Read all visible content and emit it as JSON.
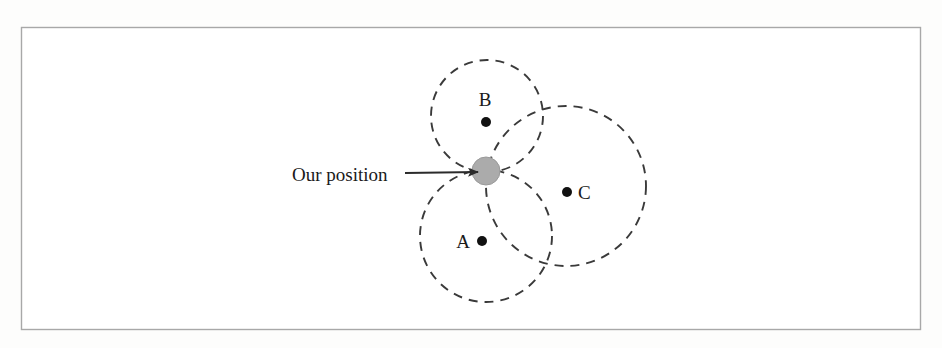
{
  "figure": {
    "name": "trilateration-position-diagram",
    "background_color": "#fdfdfc",
    "frame": {
      "name": "figure-border",
      "x": 21,
      "y": 27,
      "width": 900,
      "height": 303,
      "stroke_color": "#a8a8a8",
      "fill_color": "#ffffff"
    },
    "callout": {
      "label": "Our position",
      "label_x": 292,
      "label_y": 181,
      "arrow": {
        "name": "callout-arrow",
        "x1": 405,
        "y1": 173,
        "x2": 478,
        "y2": 172,
        "color": "#2b2b2b"
      }
    },
    "our_position_marker": {
      "name": "our-position-marker",
      "cx": 486,
      "cy": 171,
      "r": 14,
      "fill_color": "#ababab",
      "stroke_color": "#9a9a9a"
    },
    "circles": [
      {
        "id": "B",
        "name": "range-circle-b",
        "cx": 487,
        "cy": 116,
        "r": 56,
        "stroke_color": "#3a3a3a",
        "dash": "9 7"
      },
      {
        "id": "A",
        "name": "range-circle-a",
        "cx": 486,
        "cy": 236,
        "r": 66,
        "stroke_color": "#3a3a3a",
        "dash": "9 7"
      },
      {
        "id": "C",
        "name": "range-circle-c",
        "cx": 566,
        "cy": 186,
        "r": 80,
        "stroke_color": "#3a3a3a",
        "dash": "9 7"
      }
    ],
    "nodes": [
      {
        "id": "B",
        "name": "node-b",
        "label": "B",
        "label_x": 485,
        "label_y": 106,
        "label_anchor": "middle",
        "dot_cx": 486,
        "dot_cy": 122,
        "dot_r": 5,
        "dot_color": "#111111"
      },
      {
        "id": "A",
        "name": "node-a",
        "label": "A",
        "label_x": 470,
        "label_y": 248,
        "label_anchor": "end",
        "dot_cx": 482,
        "dot_cy": 241,
        "dot_r": 5,
        "dot_color": "#111111"
      },
      {
        "id": "C",
        "name": "node-c",
        "label": "C",
        "label_x": 578,
        "label_y": 199,
        "label_anchor": "start",
        "dot_cx": 567,
        "dot_cy": 192,
        "dot_r": 5,
        "dot_color": "#111111"
      }
    ]
  }
}
